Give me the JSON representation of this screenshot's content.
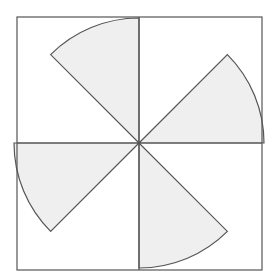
{
  "diagram": {
    "colors": {
      "line": "#555555",
      "sector_fill": "#efefef",
      "background": "#ffffff"
    },
    "square": {
      "x": 17,
      "y": 17,
      "size": 245
    },
    "center": {
      "x": 139,
      "y": 143
    },
    "radius": 125,
    "sectors": [
      {
        "name": "top",
        "from_deg": 90,
        "to_deg": 135
      },
      {
        "name": "right",
        "from_deg": 0,
        "to_deg": 45
      },
      {
        "name": "left",
        "from_deg": 180,
        "to_deg": 225
      },
      {
        "name": "bottom",
        "from_deg": 270,
        "to_deg": 315
      }
    ]
  }
}
